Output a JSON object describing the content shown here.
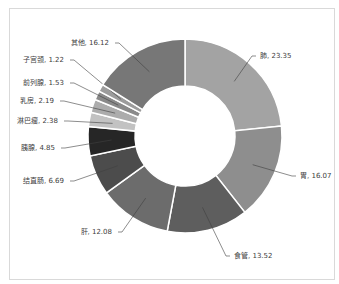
{
  "chart_data": {
    "type": "pie",
    "subtype": "doughnut",
    "title": "",
    "categories": [
      "肺",
      "胃",
      "食管",
      "肝",
      "结直肠",
      "胰腺",
      "淋巴瘤",
      "乳房",
      "前列腺",
      "子宫颈",
      "其他"
    ],
    "values": [
      23.35,
      16.07,
      13.52,
      12.08,
      6.69,
      4.85,
      2.38,
      2.19,
      1.53,
      1.22,
      16.12
    ],
    "colors": [
      "#a3a3a3",
      "#8e8e8e",
      "#5e5e5e",
      "#6c6c6c",
      "#4c4c4c",
      "#262626",
      "#c2c2c2",
      "#acacac",
      "#8a8a8a",
      "#9c9c9c",
      "#777777"
    ],
    "labels": [
      "肺, 23.35",
      "胃, 16.07",
      "食管, 13.52",
      "肝, 12.08",
      "结直肠, 6.69",
      "胰腺, 4.85",
      "淋巴瘤, 2.38",
      "乳房, 2.19",
      "前列腺, 1.53",
      "子宫颈, 1.22",
      "其他, 16.12"
    ],
    "label_positions": [
      {
        "x": 258,
        "y": 58,
        "anchor": "start",
        "lx": 256,
        "ly": 56
      },
      {
        "x": 298,
        "y": 178,
        "anchor": "start",
        "lx": 296,
        "ly": 176
      },
      {
        "x": 232,
        "y": 258,
        "anchor": "start",
        "lx": 230,
        "ly": 256
      },
      {
        "x": 114,
        "y": 234,
        "anchor": "end",
        "lx": 118,
        "ly": 232
      },
      {
        "x": 66,
        "y": 183,
        "anchor": "end",
        "lx": 70,
        "ly": 181
      },
      {
        "x": 57,
        "y": 150,
        "anchor": "end",
        "lx": 61,
        "ly": 148
      },
      {
        "x": 60,
        "y": 123,
        "anchor": "end",
        "lx": 64,
        "ly": 121
      },
      {
        "x": 56,
        "y": 103,
        "anchor": "end",
        "lx": 60,
        "ly": 101
      },
      {
        "x": 66,
        "y": 85,
        "anchor": "end",
        "lx": 70,
        "ly": 83
      },
      {
        "x": 66,
        "y": 62,
        "anchor": "end",
        "lx": 70,
        "ly": 60
      },
      {
        "x": 111,
        "y": 45,
        "anchor": "end",
        "lx": 115,
        "ly": 43
      }
    ],
    "start_angle_deg": 0,
    "direction": "clockwise",
    "center": [
      185,
      136
    ],
    "outer_radius": 97,
    "inner_radius": 50,
    "legend": "none",
    "data_labels": "category, value with leader lines"
  }
}
